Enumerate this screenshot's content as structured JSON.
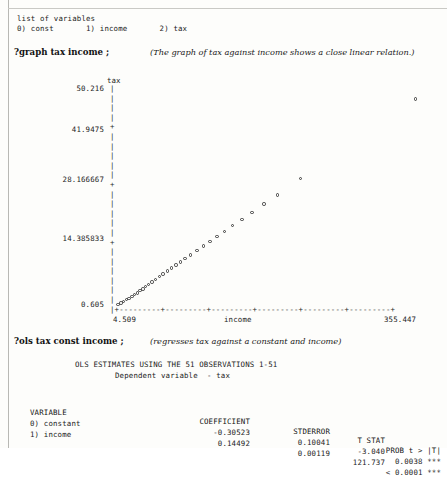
{
  "session": {
    "variables_header": "list of variables",
    "variables_line": "0) const       1) income       2) tax",
    "variables": [
      {
        "index": "0)",
        "name": "const"
      },
      {
        "index": "1)",
        "name": "income"
      },
      {
        "index": "2)",
        "name": "tax"
      }
    ],
    "graph_command": "?graph tax income ;",
    "graph_note": "(The graph of tax against income shows a close linear relation.)",
    "ols_command": "?ols tax const income ;",
    "ols_note": "(regresses tax against a constant and income)",
    "ols_title_line1": "OLS ESTIMATES USING THE 51 OBSERVATIONS 1-51",
    "ols_title_line2": "Dependent variable  - tax"
  },
  "regression": {
    "columns": [
      "VARIABLE",
      "COEFFICIENT",
      "STDERROR",
      "T STAT",
      "PROB t > |T|"
    ],
    "rows": [
      {
        "variable": "0) constant",
        "coefficient": "-0.30523",
        "stderror": "0.10041",
        "tstat": "-3.040",
        "prob": "0.0038 ***"
      },
      {
        "variable": "1) income",
        "coefficient": "0.14492",
        "stderror": "0.00119",
        "tstat": "121.737",
        "prob": "< 0.0001 ***"
      }
    ]
  },
  "chart_data": {
    "type": "scatter",
    "title": "",
    "xlabel": "income",
    "ylabel": "tax",
    "xlim": [
      4.509,
      355.447
    ],
    "ylim": [
      0.605,
      50.216
    ],
    "xticklabels": [
      "4.509",
      "355.447"
    ],
    "yticklabels": [
      "50.216",
      "41.9475",
      "28.166667",
      "14.385833",
      "0.605"
    ],
    "ytickvalues": [
      50.216,
      41.9475,
      28.166667,
      14.385833,
      0.605
    ],
    "grid": false,
    "legend": null,
    "marker": "o",
    "axis_style": "ascii",
    "n_observations": 51,
    "points": [
      {
        "x": 6.0,
        "y": 0.68
      },
      {
        "x": 9.0,
        "y": 0.95
      },
      {
        "x": 12.0,
        "y": 1.3
      },
      {
        "x": 15.0,
        "y": 1.75
      },
      {
        "x": 18.0,
        "y": 2.05
      },
      {
        "x": 21.0,
        "y": 2.5
      },
      {
        "x": 24.0,
        "y": 2.95
      },
      {
        "x": 27.0,
        "y": 3.3
      },
      {
        "x": 30.0,
        "y": 3.8
      },
      {
        "x": 33.0,
        "y": 4.2
      },
      {
        "x": 36.0,
        "y": 4.7
      },
      {
        "x": 39.0,
        "y": 5.2
      },
      {
        "x": 43.0,
        "y": 5.8
      },
      {
        "x": 47.0,
        "y": 6.4
      },
      {
        "x": 51.0,
        "y": 7.05
      },
      {
        "x": 55.0,
        "y": 7.6
      },
      {
        "x": 60.0,
        "y": 8.3
      },
      {
        "x": 64.0,
        "y": 8.95
      },
      {
        "x": 69.0,
        "y": 9.7
      },
      {
        "x": 74.0,
        "y": 10.4
      },
      {
        "x": 79.0,
        "y": 11.1
      },
      {
        "x": 85.0,
        "y": 11.95
      },
      {
        "x": 92.0,
        "y": 13.0
      },
      {
        "x": 99.0,
        "y": 14.0
      },
      {
        "x": 106.0,
        "y": 15.05
      },
      {
        "x": 114.0,
        "y": 16.2
      },
      {
        "x": 122.0,
        "y": 17.4
      },
      {
        "x": 131.0,
        "y": 18.7
      },
      {
        "x": 141.0,
        "y": 20.1
      },
      {
        "x": 152.0,
        "y": 21.7
      },
      {
        "x": 165.0,
        "y": 23.6
      },
      {
        "x": 180.0,
        "y": 25.7
      },
      {
        "x": 205.0,
        "y": 29.4
      },
      {
        "x": 330.0,
        "y": 47.6
      }
    ]
  }
}
